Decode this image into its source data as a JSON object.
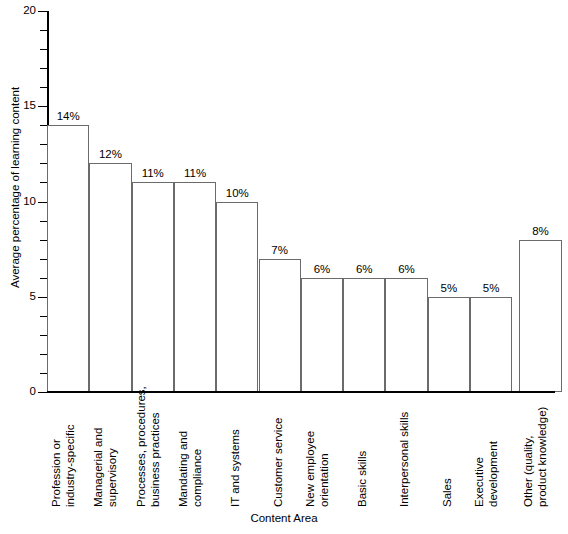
{
  "chart_data": {
    "type": "bar",
    "title": "",
    "xlabel": "Content Area",
    "ylabel": "Average percentage of learning content",
    "ylim": [
      0,
      20
    ],
    "y_major_ticks": [
      0,
      5,
      10,
      15,
      20
    ],
    "y_minor_tick_step": 1,
    "grid": false,
    "legend": null,
    "categories": [
      "Profession or industry-specific",
      "Managerial and supervisory",
      "Processes, procedures, business practices",
      "Mandating and compliance",
      "IT and systems",
      "Customer service",
      "New employee orientation",
      "Basic skills",
      "Interpersonal skills",
      "Sales",
      "Executive development",
      "Other (quality, product knowledge)"
    ],
    "category_lines": [
      [
        "Profession or",
        "industry-specific"
      ],
      [
        "Managerial and",
        "supervisory"
      ],
      [
        "Processes, procedures,",
        "business practices"
      ],
      [
        "Mandating and",
        "compliance"
      ],
      [
        "IT and systems"
      ],
      [
        "Customer service"
      ],
      [
        "New employee",
        "orientation"
      ],
      [
        "Basic skills"
      ],
      [
        "Interpersonal skills"
      ],
      [
        "Sales"
      ],
      [
        "Executive",
        "development"
      ],
      [
        "Other (quality,",
        "product knowledge)"
      ]
    ],
    "values": [
      14,
      12,
      11,
      11,
      10,
      7,
      6,
      6,
      6,
      5,
      5,
      8
    ],
    "value_labels": [
      "14%",
      "12%",
      "11%",
      "11%",
      "10%",
      "7%",
      "6%",
      "6%",
      "6%",
      "5%",
      "5%",
      "8%"
    ]
  },
  "axis": {
    "y_tick_labels": [
      "20",
      "15",
      "10",
      "5",
      "0"
    ],
    "x_title": "Content Area",
    "y_title": "Average percentage of learning content"
  },
  "style": {
    "bar_fill": "#ffffff",
    "bar_stroke": "#6b6b6b",
    "axis_color": "#000000",
    "background": "#ffffff",
    "text_color": "#000000"
  }
}
